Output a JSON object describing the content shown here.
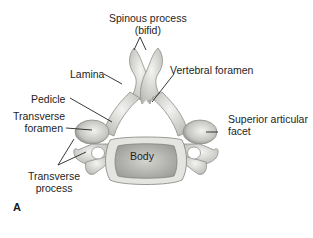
{
  "figure": {
    "panel_letter": "A"
  },
  "labels": {
    "spinous_process": "Spinous process",
    "spinous_process_note": "(bifid)",
    "lamina": "Lamina",
    "vertebral_foramen": "Vertebral foramen",
    "pedicle": "Pedicle",
    "transverse_foramen_1": "Transverse",
    "transverse_foramen_2": "foramen",
    "superior_articular_facet_1": "Superior articular",
    "superior_articular_facet_2": "facet",
    "body": "Body",
    "transverse_process_1": "Transverse",
    "transverse_process_2": "process"
  },
  "colors": {
    "bone": "#e6e6e2",
    "bone_shadow": "#9a9a96",
    "body_fill": "#bdbdb8",
    "leader_line": "#222222"
  }
}
